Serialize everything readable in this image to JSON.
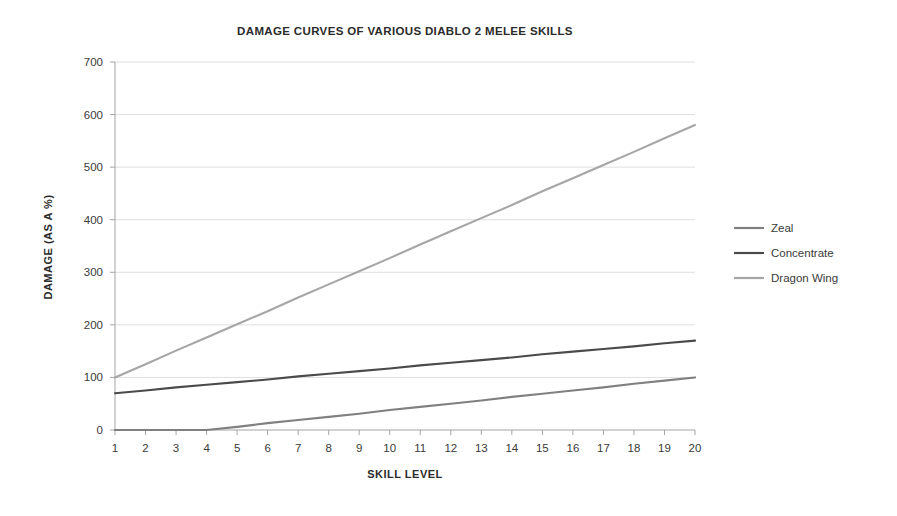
{
  "chart_data": {
    "type": "line",
    "title": "DAMAGE CURVES OF VARIOUS DIABLO 2 MELEE SKILLS",
    "xlabel": "SKILL LEVEL",
    "ylabel": "DAMAGE (AS A %)",
    "x": [
      1,
      2,
      3,
      4,
      5,
      6,
      7,
      8,
      9,
      10,
      11,
      12,
      13,
      14,
      15,
      16,
      17,
      18,
      19,
      20
    ],
    "categories": [
      "1",
      "2",
      "3",
      "4",
      "5",
      "6",
      "7",
      "8",
      "9",
      "10",
      "11",
      "12",
      "13",
      "14",
      "15",
      "16",
      "17",
      "18",
      "19",
      "20"
    ],
    "xlim": [
      1,
      20
    ],
    "ylim": [
      0,
      700
    ],
    "yticks": [
      0,
      100,
      200,
      300,
      400,
      500,
      600,
      700
    ],
    "ytick_labels": [
      "0",
      "100",
      "200",
      "300",
      "400",
      "500",
      "600",
      "700"
    ],
    "grid": true,
    "legend_position": "right",
    "series": [
      {
        "name": "Zeal",
        "color": "#808080",
        "values": [
          0,
          0,
          0,
          0,
          6,
          13,
          19,
          25,
          31,
          38,
          44,
          50,
          56,
          63,
          69,
          75,
          81,
          88,
          94,
          100
        ]
      },
      {
        "name": "Concentrate",
        "color": "#4a4a4a",
        "values": [
          70,
          75,
          81,
          86,
          91,
          96,
          102,
          107,
          112,
          117,
          123,
          128,
          133,
          138,
          144,
          149,
          154,
          159,
          165,
          170
        ]
      },
      {
        "name": "Dragon Wing",
        "color": "#a6a6a6",
        "values": [
          100,
          125,
          151,
          176,
          201,
          226,
          252,
          277,
          302,
          327,
          353,
          378,
          403,
          428,
          454,
          479,
          504,
          529,
          555,
          580
        ]
      }
    ]
  },
  "legend": {
    "items": [
      {
        "label": "Zeal",
        "color": "#808080"
      },
      {
        "label": "Concentrate",
        "color": "#4a4a4a"
      },
      {
        "label": "Dragon Wing",
        "color": "#a6a6a6"
      }
    ]
  }
}
